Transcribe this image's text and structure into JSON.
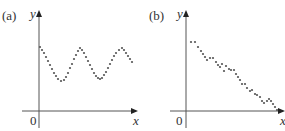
{
  "chart_data": [
    {
      "type": "scatter",
      "panel_label": "(a)",
      "title": "",
      "xlabel": "x",
      "ylabel": "y",
      "origin_label": "0",
      "grid": false,
      "axis_color": "#555555",
      "point_color": "#555555",
      "description": "Oscillating (sinusoidal-like) scatter pattern above the x-axis",
      "points": [
        [
          40,
          47
        ],
        [
          42,
          50
        ],
        [
          44,
          53
        ],
        [
          46,
          57
        ],
        [
          48,
          61
        ],
        [
          50,
          65
        ],
        [
          52,
          69
        ],
        [
          54,
          73
        ],
        [
          56,
          76
        ],
        [
          58,
          79
        ],
        [
          61,
          81
        ],
        [
          64,
          80
        ],
        [
          66,
          77
        ],
        [
          68,
          73
        ],
        [
          70,
          68
        ],
        [
          72,
          64
        ],
        [
          74,
          59
        ],
        [
          76,
          55
        ],
        [
          78,
          51
        ],
        [
          80,
          48
        ],
        [
          82,
          50
        ],
        [
          84,
          53
        ],
        [
          86,
          57
        ],
        [
          88,
          61
        ],
        [
          90,
          65
        ],
        [
          92,
          69
        ],
        [
          94,
          73
        ],
        [
          96,
          76
        ],
        [
          98,
          78
        ],
        [
          100,
          79
        ],
        [
          102,
          78
        ],
        [
          104,
          75
        ],
        [
          106,
          72
        ],
        [
          108,
          68
        ],
        [
          110,
          64
        ],
        [
          112,
          60
        ],
        [
          114,
          56
        ],
        [
          116,
          53
        ],
        [
          119,
          50
        ],
        [
          122,
          48
        ],
        [
          124,
          50
        ],
        [
          126,
          53
        ],
        [
          128,
          56
        ],
        [
          130,
          59
        ],
        [
          132,
          62
        ]
      ],
      "plot_box": {
        "x_axis_y": 111,
        "y_axis_x": 39,
        "x_min": 22,
        "x_max": 138,
        "y_top": 10,
        "y_bottom": 128
      }
    },
    {
      "type": "scatter",
      "panel_label": "(b)",
      "title": "",
      "xlabel": "x",
      "ylabel": "y",
      "origin_label": "0",
      "grid": false,
      "axis_color": "#555555",
      "point_color": "#555555",
      "description": "Scatter with decreasing, roughly linear negative trend",
      "points": [
        [
          48,
          42
        ],
        [
          52,
          42
        ],
        [
          55,
          47
        ],
        [
          58,
          51
        ],
        [
          60,
          54
        ],
        [
          62,
          57
        ],
        [
          64,
          60
        ],
        [
          67,
          58
        ],
        [
          70,
          58
        ],
        [
          73,
          62
        ],
        [
          75,
          65
        ],
        [
          77,
          67
        ],
        [
          79,
          64
        ],
        [
          81,
          71
        ],
        [
          83,
          66
        ],
        [
          86,
          69
        ],
        [
          88,
          70
        ],
        [
          91,
          70
        ],
        [
          93,
          74
        ],
        [
          95,
          77
        ],
        [
          97,
          80
        ],
        [
          99,
          84
        ],
        [
          102,
          84
        ],
        [
          104,
          88
        ],
        [
          107,
          91
        ],
        [
          109,
          90
        ],
        [
          112,
          94
        ],
        [
          114,
          95
        ],
        [
          117,
          97
        ],
        [
          119,
          101
        ],
        [
          121,
          103
        ],
        [
          124,
          101
        ],
        [
          126,
          99
        ],
        [
          128,
          101
        ],
        [
          130,
          104
        ],
        [
          132,
          107
        ],
        [
          134,
          110
        ]
      ],
      "plot_box": {
        "x_axis_y": 111,
        "y_axis_x": 43,
        "x_min": 27,
        "x_max": 142,
        "y_top": 10,
        "y_bottom": 128
      }
    }
  ]
}
